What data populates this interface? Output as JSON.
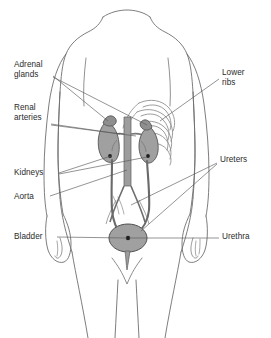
{
  "colors": {
    "background": "#ffffff",
    "body_outline": "#6e6e6e",
    "skeleton_outline": "#8a8a8a",
    "organ_fill": "#a0a0a0",
    "organ_outline": "#555555",
    "vessel_fill": "#9d9d9d",
    "leader_line": "#595959",
    "label_text": "#2b2b2b"
  },
  "labels": {
    "left": [
      {
        "id": "adrenal-glands",
        "text": "Adrenal\nglands",
        "x": 14,
        "y": 60
      },
      {
        "id": "renal-arteries",
        "text": "Renal\narteries",
        "x": 14,
        "y": 103
      },
      {
        "id": "kidneys",
        "text": "Kidneys",
        "x": 14,
        "y": 168
      },
      {
        "id": "aorta",
        "text": "Aorta",
        "x": 14,
        "y": 192
      },
      {
        "id": "bladder",
        "text": "Bladder",
        "x": 14,
        "y": 232
      }
    ],
    "right": [
      {
        "id": "lower-ribs",
        "text": "Lower\nribs",
        "x": 222,
        "y": 68
      },
      {
        "id": "ureters",
        "text": "Ureters",
        "x": 220,
        "y": 155
      },
      {
        "id": "urethra",
        "text": "Urethra",
        "x": 222,
        "y": 232
      }
    ]
  },
  "organs": [
    {
      "id": "left-kidney",
      "name": "Kidney (left)"
    },
    {
      "id": "right-kidney",
      "name": "Kidney (right)"
    },
    {
      "id": "left-adrenal",
      "name": "Adrenal gland (left)"
    },
    {
      "id": "right-adrenal",
      "name": "Adrenal gland (right)"
    },
    {
      "id": "aorta-vessel",
      "name": "Aorta"
    },
    {
      "id": "renal-artery-left",
      "name": "Renal artery (left)"
    },
    {
      "id": "renal-artery-right",
      "name": "Renal artery (right)"
    },
    {
      "id": "ureter-left",
      "name": "Ureter (left)"
    },
    {
      "id": "ureter-right",
      "name": "Ureter (right)"
    },
    {
      "id": "bladder-organ",
      "name": "Bladder"
    },
    {
      "id": "urethra-tube",
      "name": "Urethra"
    },
    {
      "id": "rib-cage",
      "name": "Lower ribs"
    }
  ]
}
